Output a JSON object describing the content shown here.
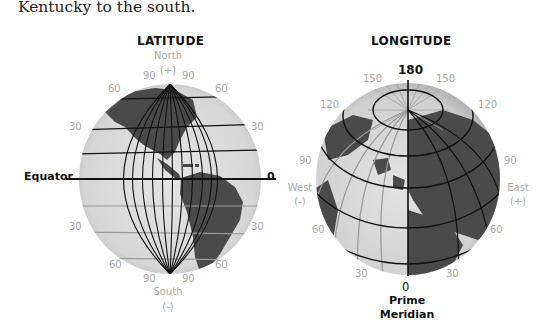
{
  "intro_text": "Kentucky to the south.",
  "latitude": {
    "title": "LATITUDE",
    "north_label": "North",
    "north_sign": "(+)",
    "south_label": "South",
    "south_sign": "(-)",
    "equator_label": "Equator",
    "zero_label": "0",
    "ticks": {
      "n90_left": "90",
      "n90_right": "90",
      "n60_left": "60",
      "n60_right": "60",
      "n30_left": "30",
      "n30_right": "30",
      "s30_left": "30",
      "s30_right": "30",
      "s60_left": "60",
      "s60_right": "60",
      "s90_left": "90",
      "s90_right": "90"
    }
  },
  "longitude": {
    "title": "LONGITUDE",
    "top_label": "180",
    "bottom_label": "0",
    "prime_meridian_line1": "Prime",
    "prime_meridian_line2": "Meridian",
    "west_label": "West",
    "west_sign": "(-)",
    "east_label": "East",
    "east_sign": "(+)",
    "ticks": {
      "w150": "150",
      "e150": "150",
      "w120": "120",
      "e120": "120",
      "w90": "90",
      "e90": "90",
      "w60": "60",
      "e60": "60",
      "w30": "30",
      "e30": "30"
    }
  },
  "colors": {
    "globe_fill": "#dcdcdc",
    "land": "#4a4a4a",
    "grid_dark": "#111111",
    "grid_light": "#9a9a9a",
    "muted_text": "#a7a7a7"
  }
}
